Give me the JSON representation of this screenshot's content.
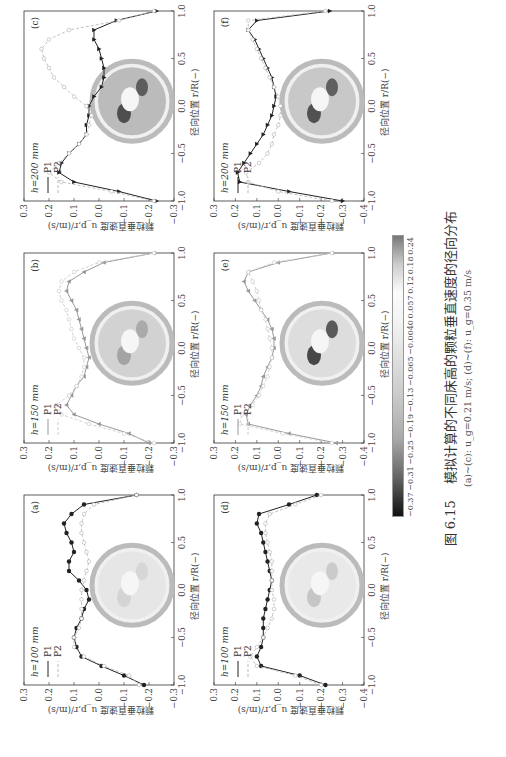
{
  "figure": {
    "caption_number": "图 6.15",
    "caption_text": "模拟计算的不同床高的颗粒垂直速度的径向分布",
    "subcaption": "(a)~(c): u_g=0.21 m/s; (d)~(f): u_g=0.35 m/s",
    "x_axis_label": "径向位置 r/R(−)",
    "y_axis_label": "颗粒垂直速度 u_p,r/(m/s)"
  },
  "colorbar": {
    "ticks": [
      "−0.37",
      "−0.31",
      "−0.25",
      "−0.19",
      "−0.13",
      "−0.065",
      "−0.0040",
      "0.057",
      "0.12",
      "0.18",
      "0.24"
    ]
  },
  "panels": [
    {
      "id": "a",
      "tag": "(a)",
      "height_label": "h=100 mm",
      "legend": [
        "P1",
        "P2"
      ],
      "p1_marker": "circle",
      "ylim": [
        -0.3,
        0.3
      ],
      "yticks": [
        "0.3",
        "0.2",
        "0.1",
        "0.0",
        "−0.1",
        "−0.2",
        "−0.3"
      ],
      "xticks": [
        "−1.0",
        "−0.5",
        "0.0",
        "0.5",
        "1.0"
      ]
    },
    {
      "id": "b",
      "tag": "(b)",
      "height_label": "h=150 mm",
      "legend": [
        "P1",
        "P2"
      ],
      "p1_marker": "triangle-up",
      "ylim": [
        -0.3,
        0.3
      ],
      "yticks": [
        "0.3",
        "0.2",
        "0.1",
        "0.0",
        "−0.1",
        "−0.2",
        "−0.3"
      ],
      "xticks": [
        "−1.0",
        "−0.5",
        "0.0",
        "0.5",
        "1.0"
      ]
    },
    {
      "id": "c",
      "tag": "(c)",
      "height_label": "h=200 mm",
      "legend": [
        "P1",
        "P2"
      ],
      "p1_marker": "triangle-down",
      "ylim": [
        -0.3,
        0.3
      ],
      "yticks": [
        "0.3",
        "0.2",
        "0.1",
        "0.0",
        "−0.1",
        "−0.2",
        "−0.3"
      ],
      "xticks": [
        "−1.0",
        "−0.5",
        "0.0",
        "0.5",
        "1.0"
      ]
    },
    {
      "id": "d",
      "tag": "(d)",
      "height_label": "h=100 mm",
      "legend": [
        "P1",
        "P2"
      ],
      "p1_marker": "circle",
      "ylim": [
        -0.4,
        0.3
      ],
      "yticks": [
        "0.3",
        "0.2",
        "0.1",
        "0.0",
        "−0.1",
        "−0.2",
        "−0.3",
        "−0.4"
      ],
      "xticks": [
        "−1.0",
        "−0.5",
        "0.0",
        "0.5",
        "1.0"
      ]
    },
    {
      "id": "e",
      "tag": "(e)",
      "height_label": "h=150 mm",
      "legend": [
        "P1",
        "P2"
      ],
      "p1_marker": "triangle-up",
      "ylim": [
        -0.4,
        0.3
      ],
      "yticks": [
        "0.3",
        "0.2",
        "0.1",
        "0.0",
        "−0.1",
        "−0.2",
        "−0.3",
        "−0.4"
      ],
      "xticks": [
        "−1.0",
        "−0.5",
        "0.0",
        "0.5",
        "1.0"
      ]
    },
    {
      "id": "f",
      "tag": "(f)",
      "height_label": "h=200 mm",
      "legend": [
        "P1",
        "P2"
      ],
      "p1_marker": "triangle-down",
      "ylim": [
        -0.4,
        0.3
      ],
      "yticks": [
        "0.3",
        "0.2",
        "0.1",
        "0.0",
        "−0.1",
        "−0.2",
        "−0.3",
        "−0.4"
      ],
      "xticks": [
        "−1.0",
        "−0.5",
        "0.0",
        "0.5",
        "1.0"
      ]
    }
  ],
  "chart_data": [
    {
      "type": "line",
      "title": "(a) h=100 mm",
      "xlabel": "径向位置 r/R(−)",
      "ylabel": "颗粒垂直速度 u_p,r/(m/s)",
      "xlim": [
        -1,
        1
      ],
      "ylim": [
        -0.3,
        0.3
      ],
      "x": [
        -1.0,
        -0.9,
        -0.8,
        -0.7,
        -0.6,
        -0.5,
        -0.4,
        -0.3,
        -0.2,
        -0.1,
        0.0,
        0.1,
        0.2,
        0.3,
        0.4,
        0.5,
        0.6,
        0.7,
        0.8,
        0.9,
        1.0
      ],
      "series": [
        {
          "name": "P1",
          "values": [
            -0.18,
            -0.1,
            -0.01,
            0.07,
            0.09,
            0.1,
            0.09,
            0.07,
            0.06,
            0.04,
            0.05,
            0.08,
            0.12,
            0.12,
            0.1,
            0.11,
            0.13,
            0.14,
            0.11,
            0.06,
            -0.15
          ]
        },
        {
          "name": "P2",
          "values": [
            -0.16,
            -0.12,
            -0.02,
            0.06,
            0.1,
            0.1,
            0.08,
            0.07,
            0.07,
            0.07,
            0.07,
            0.06,
            0.05,
            0.04,
            0.05,
            0.06,
            0.07,
            0.07,
            0.06,
            0.02,
            -0.15
          ]
        }
      ]
    },
    {
      "type": "line",
      "title": "(b) h=150 mm",
      "xlabel": "径向位置 r/R(−)",
      "ylabel": "颗粒垂直速度 u_p,r/(m/s)",
      "xlim": [
        -1,
        1
      ],
      "ylim": [
        -0.3,
        0.3
      ],
      "x": [
        -1.0,
        -0.9,
        -0.8,
        -0.7,
        -0.6,
        -0.5,
        -0.4,
        -0.3,
        -0.2,
        -0.1,
        0.0,
        0.1,
        0.2,
        0.3,
        0.4,
        0.5,
        0.6,
        0.7,
        0.8,
        0.9,
        1.0
      ],
      "series": [
        {
          "name": "P1",
          "values": [
            -0.2,
            -0.12,
            0.0,
            0.1,
            0.13,
            0.11,
            0.09,
            0.06,
            0.05,
            0.04,
            0.05,
            0.06,
            0.07,
            0.08,
            0.09,
            0.11,
            0.13,
            0.12,
            0.06,
            -0.02,
            -0.22
          ]
        },
        {
          "name": "P2",
          "values": [
            -0.22,
            -0.1,
            0.04,
            0.15,
            0.17,
            0.12,
            0.09,
            0.07,
            0.06,
            0.06,
            0.08,
            0.1,
            0.11,
            0.12,
            0.13,
            0.15,
            0.16,
            0.15,
            0.1,
            0.0,
            -0.22
          ]
        }
      ]
    },
    {
      "type": "line",
      "title": "(c) h=200 mm",
      "xlabel": "径向位置 r/R(−)",
      "ylabel": "颗粒垂直速度 u_p,r/(m/s)",
      "xlim": [
        -1,
        1
      ],
      "ylim": [
        -0.3,
        0.3
      ],
      "x": [
        -1.0,
        -0.9,
        -0.8,
        -0.7,
        -0.6,
        -0.5,
        -0.4,
        -0.3,
        -0.2,
        -0.1,
        0.0,
        0.1,
        0.2,
        0.3,
        0.4,
        0.5,
        0.6,
        0.7,
        0.8,
        0.9,
        1.0
      ],
      "series": [
        {
          "name": "P1",
          "values": [
            -0.23,
            -0.08,
            0.1,
            0.16,
            0.15,
            0.12,
            0.08,
            0.05,
            0.05,
            0.04,
            0.04,
            0.02,
            -0.01,
            -0.02,
            -0.02,
            -0.01,
            0.0,
            0.02,
            0.02,
            -0.07,
            -0.23
          ]
        },
        {
          "name": "P2",
          "values": [
            -0.22,
            -0.05,
            0.15,
            0.2,
            0.16,
            0.12,
            0.08,
            0.05,
            0.04,
            0.03,
            0.05,
            0.1,
            0.14,
            0.18,
            0.2,
            0.22,
            0.23,
            0.2,
            0.12,
            -0.08,
            -0.22
          ]
        }
      ]
    },
    {
      "type": "line",
      "title": "(d) h=100 mm",
      "xlabel": "径向位置 r/R(−)",
      "ylabel": "颗粒垂直速度 u_p,r/(m/s)",
      "xlim": [
        -1,
        1
      ],
      "ylim": [
        -0.4,
        0.3
      ],
      "x": [
        -1.0,
        -0.9,
        -0.8,
        -0.7,
        -0.6,
        -0.5,
        -0.4,
        -0.3,
        -0.2,
        -0.1,
        0.0,
        0.1,
        0.2,
        0.3,
        0.4,
        0.5,
        0.6,
        0.7,
        0.8,
        0.9,
        1.0
      ],
      "series": [
        {
          "name": "P1",
          "values": [
            -0.22,
            -0.1,
            0.08,
            0.1,
            0.08,
            0.07,
            0.07,
            0.07,
            0.06,
            0.05,
            0.04,
            0.03,
            0.04,
            0.05,
            0.06,
            0.07,
            0.08,
            0.1,
            0.09,
            -0.05,
            -0.18
          ]
        },
        {
          "name": "P2",
          "values": [
            -0.2,
            -0.08,
            0.1,
            0.13,
            0.1,
            0.07,
            0.05,
            0.03,
            0.02,
            0.02,
            0.03,
            0.03,
            0.03,
            0.03,
            0.04,
            0.05,
            0.06,
            0.06,
            0.04,
            -0.08,
            -0.2
          ]
        }
      ]
    },
    {
      "type": "line",
      "title": "(e) h=150 mm",
      "xlabel": "径向位置 r/R(−)",
      "ylabel": "颗粒垂直速度 u_p,r/(m/s)",
      "xlim": [
        -1,
        1
      ],
      "ylim": [
        -0.4,
        0.3
      ],
      "x": [
        -1.0,
        -0.9,
        -0.8,
        -0.7,
        -0.6,
        -0.5,
        -0.4,
        -0.3,
        -0.2,
        -0.1,
        0.0,
        0.1,
        0.2,
        0.3,
        0.4,
        0.5,
        0.6,
        0.7,
        0.8,
        0.9,
        1.0
      ],
      "series": [
        {
          "name": "P1",
          "values": [
            -0.27,
            -0.05,
            0.14,
            0.15,
            0.13,
            0.1,
            0.08,
            0.07,
            0.05,
            0.03,
            0.02,
            0.02,
            0.03,
            0.05,
            0.08,
            0.11,
            0.14,
            0.16,
            0.14,
            0.0,
            -0.25
          ]
        },
        {
          "name": "P2",
          "values": [
            -0.25,
            -0.02,
            0.18,
            0.17,
            0.12,
            0.09,
            0.07,
            0.05,
            0.04,
            0.03,
            0.03,
            0.04,
            0.05,
            0.06,
            0.08,
            0.09,
            0.1,
            0.12,
            0.14,
            0.02,
            -0.25
          ]
        }
      ]
    },
    {
      "type": "line",
      "title": "(f) h=200 mm",
      "xlabel": "径向位置 r/R(−)",
      "ylabel": "颗粒垂直速度 u_p,r/(m/s)",
      "xlim": [
        -1,
        1
      ],
      "ylim": [
        -0.4,
        0.3
      ],
      "x": [
        -1.0,
        -0.9,
        -0.8,
        -0.7,
        -0.6,
        -0.5,
        -0.4,
        -0.3,
        -0.2,
        -0.1,
        0.0,
        0.1,
        0.2,
        0.3,
        0.4,
        0.5,
        0.6,
        0.7,
        0.8,
        0.9,
        1.0
      ],
      "series": [
        {
          "name": "P1",
          "values": [
            -0.3,
            -0.05,
            0.18,
            0.19,
            0.16,
            0.13,
            0.1,
            0.07,
            0.05,
            0.03,
            0.02,
            0.01,
            0.02,
            0.03,
            0.05,
            0.07,
            0.09,
            0.11,
            0.14,
            0.1,
            -0.24
          ]
        },
        {
          "name": "P2",
          "values": [
            -0.25,
            0.0,
            0.14,
            0.15,
            0.09,
            0.05,
            0.03,
            0.02,
            0.0,
            -0.01,
            -0.01,
            0.0,
            0.02,
            0.04,
            0.06,
            0.08,
            0.1,
            0.12,
            0.14,
            0.14,
            -0.22
          ]
        }
      ]
    }
  ]
}
